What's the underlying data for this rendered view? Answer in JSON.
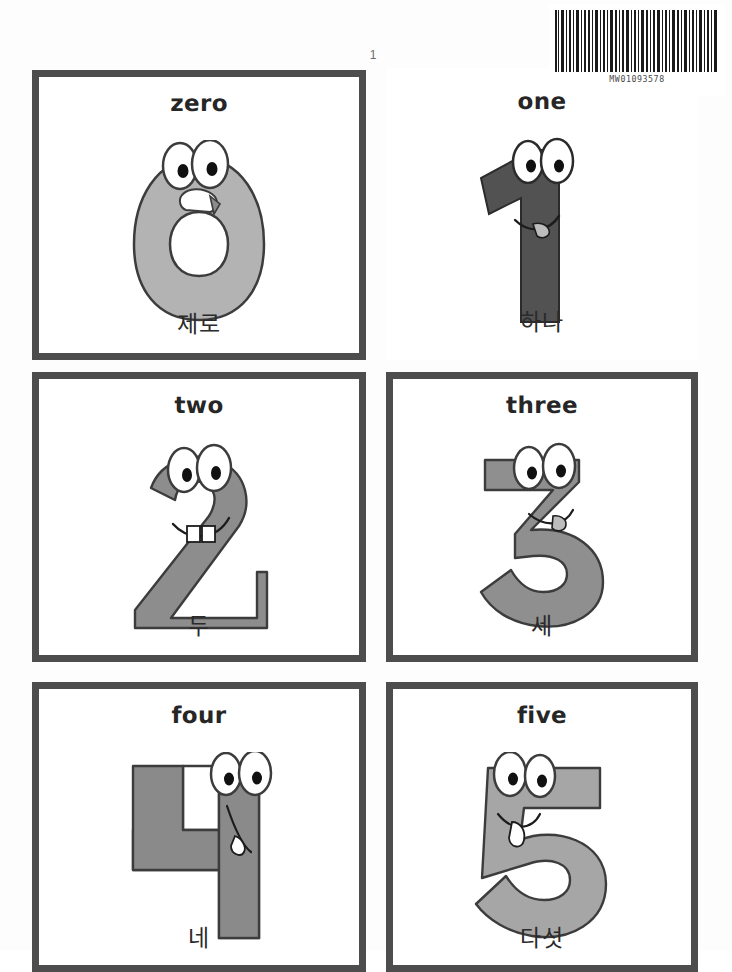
{
  "page": {
    "number": "1",
    "barcode_number": "MW01093578",
    "barcode_icon": "barcode-icon"
  },
  "cards": [
    {
      "id": "card-zero",
      "english": "zero",
      "korean": "제로",
      "digit": "0",
      "fill": "#b3b3b3",
      "stroke": "#3c3c3c"
    },
    {
      "id": "card-one",
      "english": "one",
      "korean": "하나",
      "digit": "1",
      "fill": "#525252",
      "stroke": "#2b2b2b"
    },
    {
      "id": "card-two",
      "english": "two",
      "korean": "두",
      "digit": "2",
      "fill": "#8d8d8d",
      "stroke": "#3c3c3c"
    },
    {
      "id": "card-three",
      "english": "three",
      "korean": "세",
      "digit": "3",
      "fill": "#8f8f8f",
      "stroke": "#3c3c3c"
    },
    {
      "id": "card-four",
      "english": "four",
      "korean": "네",
      "digit": "4",
      "fill": "#8a8a8a",
      "stroke": "#3c3c3c"
    },
    {
      "id": "card-five",
      "english": "five",
      "korean": "다섯",
      "digit": "5",
      "fill": "#a6a6a6",
      "stroke": "#3c3c3c"
    }
  ],
  "colors": {
    "card_border": "#4d4d4d",
    "page_background": "#fdfdfd",
    "text": "#262626"
  }
}
